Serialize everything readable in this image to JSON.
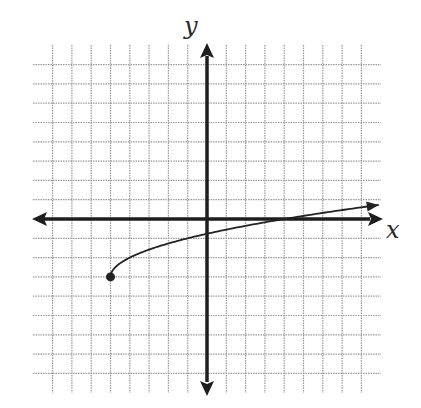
{
  "chart_data": {
    "type": "line",
    "title": "",
    "xlabel": "x",
    "ylabel": "y",
    "xlim": [
      -8,
      8
    ],
    "ylim": [
      -8,
      8
    ],
    "grid": true,
    "grid_step": 1,
    "tick_labels": false,
    "function": "y = sqrt(x + 5) - 3",
    "series": [
      {
        "name": "curve",
        "start_point": {
          "x": -5,
          "y": -3,
          "closed": true
        },
        "end": "arrow",
        "points": [
          {
            "x": -5,
            "y": -3
          },
          {
            "x": -4,
            "y": -2
          },
          {
            "x": -1,
            "y": -1
          },
          {
            "x": 0,
            "y": -0.76
          },
          {
            "x": 4,
            "y": 0
          },
          {
            "x": 8.9,
            "y": 0.73
          }
        ]
      }
    ]
  },
  "labels": {
    "x_axis": "x",
    "y_axis": "y"
  },
  "colors": {
    "axis": "#1e1e1e",
    "grid": "#9a9a9a",
    "curve": "#222222",
    "background": "#ffffff"
  }
}
